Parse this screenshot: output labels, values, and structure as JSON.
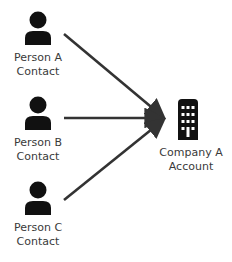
{
  "diagram": {
    "type": "many-to-one relationship",
    "colors": {
      "icon": "#111111",
      "arrow": "#333333",
      "text": "#3a3a3a",
      "background": "#ffffff"
    },
    "sources": [
      {
        "id": "person-a",
        "icon": "person-icon",
        "line1": "Person A",
        "line2": "Contact"
      },
      {
        "id": "person-b",
        "icon": "person-icon",
        "line1": "Person B",
        "line2": "Contact"
      },
      {
        "id": "person-c",
        "icon": "person-icon",
        "line1": "Person C",
        "line2": "Contact"
      }
    ],
    "target": {
      "id": "company-a",
      "icon": "building-icon",
      "line1": "Company A",
      "line2": "Account"
    },
    "edges": [
      {
        "from": "person-a",
        "to": "company-a"
      },
      {
        "from": "person-b",
        "to": "company-a"
      },
      {
        "from": "person-c",
        "to": "company-a"
      }
    ]
  }
}
